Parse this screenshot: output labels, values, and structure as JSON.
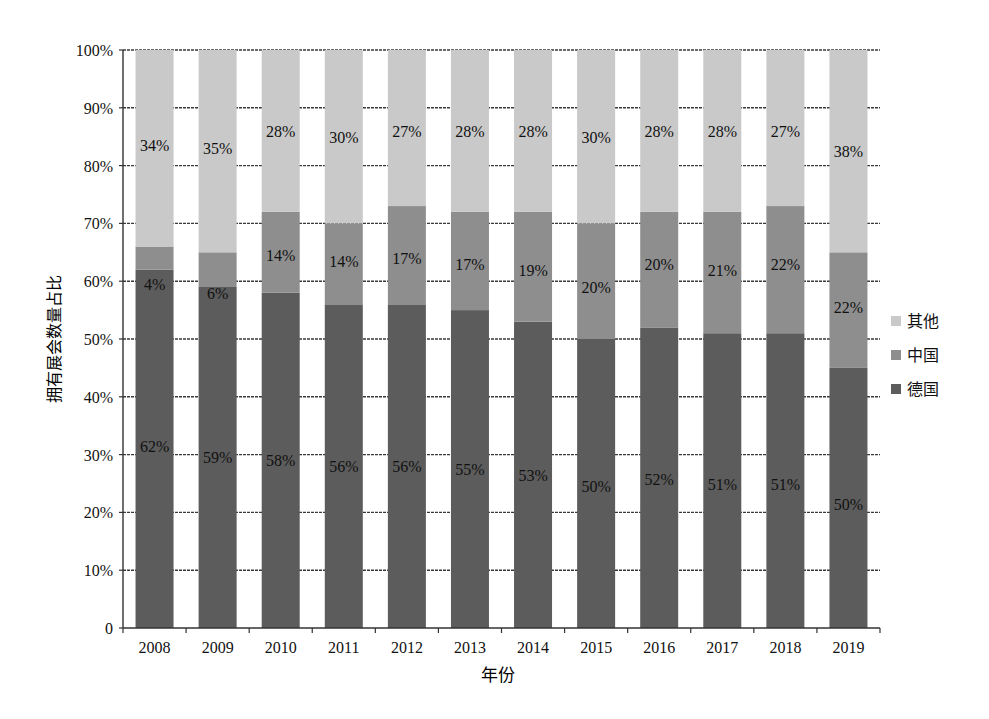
{
  "chart_data": {
    "type": "bar",
    "stacked": true,
    "title": "",
    "xlabel": "年份",
    "ylabel": "拥有展会数量占比",
    "ylim": [
      0,
      100
    ],
    "yticks": [
      "0",
      "10%",
      "20%",
      "30%",
      "40%",
      "50%",
      "60%",
      "70%",
      "80%",
      "90%",
      "100%"
    ],
    "grid": true,
    "legend_position": "right",
    "categories": [
      "2008",
      "2009",
      "2010",
      "2011",
      "2012",
      "2013",
      "2014",
      "2015",
      "2016",
      "2017",
      "2018",
      "2019"
    ],
    "series": [
      {
        "name": "德国",
        "color": "#5c5c5c",
        "values": [
          62,
          59,
          58,
          56,
          56,
          55,
          53,
          50,
          52,
          51,
          51,
          50
        ],
        "bar_top": [
          62,
          59,
          58,
          56,
          56,
          55,
          53,
          50,
          52,
          51,
          51,
          45
        ]
      },
      {
        "name": "中国",
        "color": "#8e8e8e",
        "values": [
          4,
          6,
          14,
          14,
          17,
          17,
          19,
          20,
          20,
          21,
          22,
          22
        ],
        "bar_top": [
          66,
          65,
          72,
          70,
          73,
          72,
          72,
          70,
          72,
          72,
          73,
          65
        ]
      },
      {
        "name": "其他",
        "color": "#c9c9c9",
        "values": [
          34,
          35,
          28,
          30,
          27,
          28,
          28,
          30,
          28,
          28,
          27,
          38
        ],
        "bar_top": [
          100,
          100,
          100,
          100,
          100,
          100,
          100,
          100,
          100,
          100,
          100,
          100
        ]
      }
    ],
    "legend": [
      {
        "label": "其他",
        "color": "#c9c9c9"
      },
      {
        "label": "中国",
        "color": "#8e8e8e"
      },
      {
        "label": "德国",
        "color": "#5c5c5c"
      }
    ],
    "label_positions": {
      "德国": [
        31.5,
        29.5,
        29.0,
        28.0,
        28.0,
        27.5,
        26.5,
        24.5,
        25.8,
        25.0,
        25.0,
        21.5
      ],
      "中国": [
        59.5,
        58.0,
        64.5,
        63.5,
        64.0,
        63.0,
        62.0,
        59.0,
        63.0,
        62.0,
        63.0,
        55.5
      ],
      "其他": [
        83.5,
        83.0,
        86.0,
        85.0,
        86.0,
        86.0,
        86.0,
        85.0,
        86.0,
        86.0,
        86.0,
        82.5
      ]
    }
  }
}
